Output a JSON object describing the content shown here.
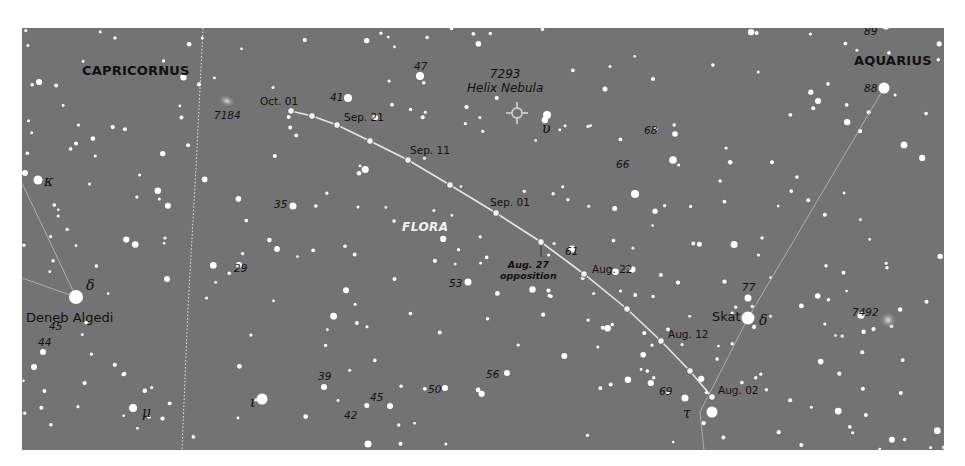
{
  "caption_fragment": "",
  "map": {
    "background": "#737373",
    "constellations": [
      {
        "name": "CAPRICORNUS",
        "x": 60,
        "y": 36
      },
      {
        "name": "AQUARIUS",
        "x": 832,
        "y": 26
      }
    ],
    "asteroid": {
      "name": "FLORA",
      "x": 380,
      "y": 193,
      "path_color": "#e6e6e6",
      "opposition": {
        "date": "Aug. 27",
        "note": "opposition",
        "x": 478,
        "y": 232
      },
      "positions": [
        {
          "label": "Oct. 01",
          "x": 269,
          "y": 83,
          "label_x": 238,
          "label_y": 68
        },
        {
          "label": "",
          "x": 290,
          "y": 88
        },
        {
          "label": "Sep. 21",
          "x": 315,
          "y": 97,
          "label_x": 322,
          "label_y": 84
        },
        {
          "label": "",
          "x": 348,
          "y": 113
        },
        {
          "label": "Sep. 11",
          "x": 386,
          "y": 132,
          "label_x": 388,
          "label_y": 117
        },
        {
          "label": "",
          "x": 428,
          "y": 157
        },
        {
          "label": "Sep. 01",
          "x": 474,
          "y": 185,
          "label_x": 468,
          "label_y": 169
        },
        {
          "label": "",
          "x": 519,
          "y": 214
        },
        {
          "label": "Aug. 22",
          "x": 562,
          "y": 246,
          "label_x": 570,
          "label_y": 236
        },
        {
          "label": "",
          "x": 605,
          "y": 281
        },
        {
          "label": "Aug. 12",
          "x": 639,
          "y": 313,
          "label_x": 646,
          "label_y": 301
        },
        {
          "label": "",
          "x": 668,
          "y": 343
        },
        {
          "label": "Aug. 02",
          "x": 690,
          "y": 369,
          "label_x": 696,
          "label_y": 357
        }
      ]
    },
    "deep_sky": [
      {
        "id": "7184",
        "x": 205,
        "y": 73,
        "label_x": 192,
        "label_y": 82,
        "type": "galaxy"
      },
      {
        "id": "7293",
        "name": "Helix Nebula",
        "x": 495,
        "y": 85,
        "label_x": 445,
        "label_y": 40,
        "type": "planetary-nebula"
      },
      {
        "id": "7492",
        "x": 866,
        "y": 292,
        "label_x": 830,
        "label_y": 279,
        "type": "globular-cluster"
      }
    ],
    "named_stars": [
      {
        "name": "Deneb Algedi",
        "greek": "δ",
        "x": 54,
        "y": 269,
        "r": 7,
        "label_x": 4,
        "label_y": 283,
        "greek_x": 64,
        "greek_y": 250
      },
      {
        "name": "Skat",
        "greek": "δ",
        "x": 726,
        "y": 290,
        "r": 6.5,
        "label_x": 690,
        "label_y": 282,
        "greek_x": 737,
        "greek_y": 285
      }
    ],
    "greek_labels": [
      {
        "symbol": "κ",
        "x": 22,
        "y": 146
      },
      {
        "symbol": "μ",
        "x": 120,
        "y": 377
      },
      {
        "symbol": "ι",
        "x": 228,
        "y": 367
      },
      {
        "symbol": "υ",
        "x": 520,
        "y": 93
      },
      {
        "symbol": "τ",
        "x": 661,
        "y": 378
      }
    ],
    "numbered_stars": [
      {
        "n": "89",
        "x": 842,
        "y": -2
      },
      {
        "n": "88",
        "x": 842,
        "y": 55
      },
      {
        "n": "47",
        "x": 392,
        "y": 33
      },
      {
        "n": "41",
        "x": 308,
        "y": 64
      },
      {
        "n": "68",
        "x": 622,
        "y": 97
      },
      {
        "n": "66",
        "x": 594,
        "y": 131
      },
      {
        "n": "35",
        "x": 252,
        "y": 171
      },
      {
        "n": "61",
        "x": 543,
        "y": 218
      },
      {
        "n": "29",
        "x": 212,
        "y": 235
      },
      {
        "n": "53",
        "x": 427,
        "y": 250
      },
      {
        "n": "77",
        "x": 720,
        "y": 254
      },
      {
        "n": "45",
        "x": 27,
        "y": 293
      },
      {
        "n": "44",
        "x": 16,
        "y": 309
      },
      {
        "n": "39",
        "x": 296,
        "y": 343
      },
      {
        "n": "56",
        "x": 464,
        "y": 341
      },
      {
        "n": "69",
        "x": 637,
        "y": 358
      },
      {
        "n": "50",
        "x": 406,
        "y": 356
      },
      {
        "n": "45",
        "x": 348,
        "y": 364
      },
      {
        "n": "42",
        "x": 322,
        "y": 382
      }
    ]
  }
}
